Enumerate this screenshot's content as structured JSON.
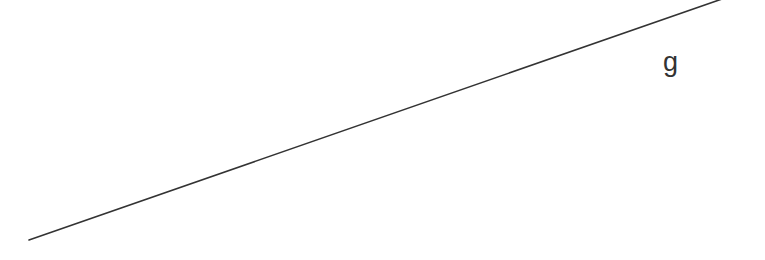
{
  "diagram": {
    "width": 765,
    "height": 260,
    "background": "#ffffff",
    "line": {
      "name": "g",
      "x1": 29,
      "y1": 240,
      "x2": 722,
      "y2": -1,
      "color": "#333333",
      "stroke_width": 1.6
    },
    "label": {
      "text": "g",
      "x": 663,
      "y": 71,
      "color": "#333333"
    }
  }
}
